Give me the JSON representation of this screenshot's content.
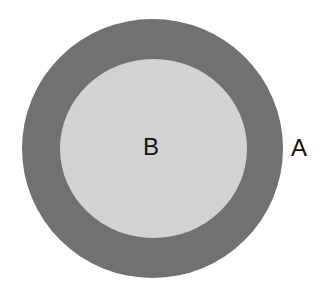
{
  "diagram": {
    "outer_region": {
      "label": "A",
      "color": "#717171"
    },
    "inner_region": {
      "label": "B",
      "color": "#d2d2d2"
    }
  }
}
